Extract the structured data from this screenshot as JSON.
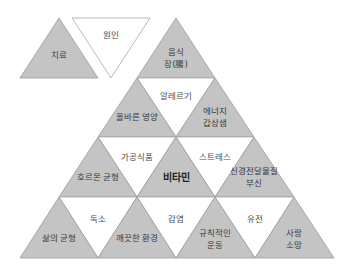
{
  "diagram": {
    "title": "",
    "colors": {
      "gray_fill": "#c4c4c4",
      "white_fill": "#ffffff",
      "outline": "#9a9a9a",
      "text": "#3a3a3a"
    },
    "top_left": {
      "treatment": "치료",
      "cause": "원인"
    },
    "pyramid": {
      "row1": {
        "food_gut": [
          "음식",
          "장(腸)"
        ]
      },
      "row2": {
        "proper_nutrition": "올바른 영양",
        "allergy": "알레르기",
        "energy_thyroid": [
          "에너지",
          "갑상샘"
        ]
      },
      "row3": {
        "hormone_balance": "호르몬 균형",
        "processed_food": "가공식품",
        "vitamin": "비타민",
        "stress": "스트레스",
        "neurotransmitter_adrenal": [
          "신경전달물질",
          "부신"
        ]
      },
      "row4": {
        "life_balance": "삶의 균형",
        "toxin": "독소",
        "clean_environment": "깨끗한 환경",
        "infection": "감염",
        "regular_exercise": [
          "규칙적인",
          "운동"
        ],
        "genetics": "유전",
        "love_hope": [
          "사랑",
          "소망"
        ]
      }
    }
  }
}
